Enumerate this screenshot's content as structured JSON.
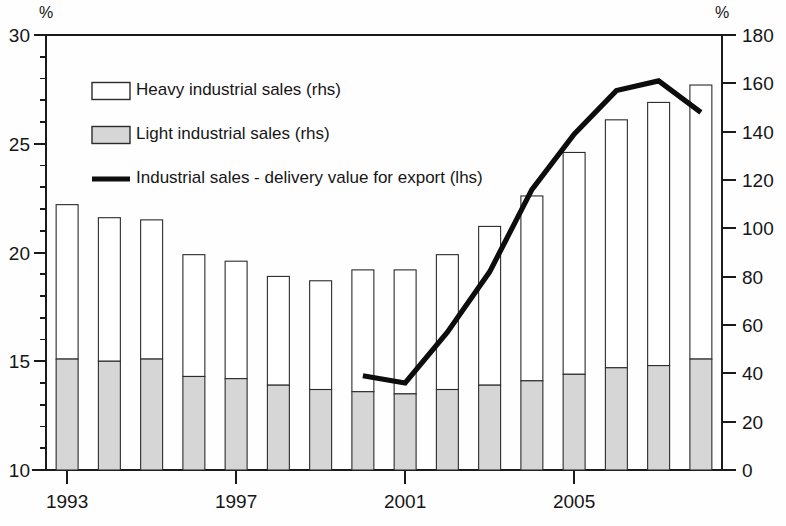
{
  "chart_data": {
    "type": "bar",
    "title": "",
    "subtitle": "",
    "xlabel": "",
    "ylabel": "%",
    "y2label": "%",
    "grid": false,
    "legend_position": "upper-left",
    "x": [
      1993,
      1994,
      1995,
      1996,
      1997,
      1998,
      1999,
      2000,
      2001,
      2002,
      2003,
      2004,
      2005,
      2006,
      2007,
      2008
    ],
    "categories": [
      "1993",
      "1994",
      "1995",
      "1996",
      "1997",
      "1998",
      "1999",
      "2000",
      "2001",
      "2002",
      "2003",
      "2004",
      "2005",
      "2006",
      "2007",
      "2008"
    ],
    "xtick_labels": [
      "1993",
      "1997",
      "2001",
      "2005"
    ],
    "xtick_values": [
      1993,
      1997,
      2001,
      2005
    ],
    "left_axis": {
      "label": "%",
      "min": 10,
      "max": 30,
      "ticks": [
        10,
        15,
        20,
        25,
        30
      ],
      "tick_labels": [
        "10",
        "15",
        "20",
        "25",
        "30"
      ]
    },
    "right_axis": {
      "label": "%",
      "min": 0,
      "max": 180,
      "ticks": [
        0,
        20,
        40,
        60,
        80,
        100,
        120,
        140,
        160,
        180
      ],
      "tick_labels": [
        "0",
        "20",
        "40",
        "60",
        "80",
        "100",
        "120",
        "140",
        "160",
        "180"
      ]
    },
    "series": [
      {
        "name": "Heavy industrial sales (rhs)",
        "type": "bar-stacked-top",
        "axis": "left",
        "values": [
          22.2,
          21.6,
          21.5,
          19.9,
          19.6,
          18.9,
          18.7,
          19.2,
          19.2,
          19.9,
          21.2,
          22.6,
          24.6,
          26.1,
          26.9,
          27.7
        ]
      },
      {
        "name": "Light industrial sales (rhs)",
        "type": "bar-stacked-bottom",
        "axis": "left",
        "values": [
          15.1,
          15.0,
          15.1,
          14.3,
          14.2,
          13.9,
          13.7,
          13.6,
          13.5,
          13.7,
          13.9,
          14.1,
          14.4,
          14.7,
          14.8,
          15.1
        ]
      },
      {
        "name": "Industrial sales - delivery value for export (lhs)",
        "type": "line",
        "axis": "right",
        "x": [
          2000,
          2001,
          2002,
          2003,
          2004,
          2005,
          2006,
          2007,
          2008
        ],
        "values": [
          39,
          36,
          57,
          82,
          116,
          139,
          157,
          161,
          148
        ]
      }
    ]
  },
  "legend": {
    "items": [
      {
        "label": "Heavy industrial sales (rhs)",
        "marker": "open-rect-swatch"
      },
      {
        "label": "Light industrial sales (rhs)",
        "marker": "gray-rect-swatch"
      },
      {
        "label": "Industrial sales - delivery value for export (lhs)",
        "marker": "thick-line-swatch"
      }
    ]
  },
  "colors": {
    "light_bar_fill": "#d6d6d6",
    "heavy_bar_fill": "#ffffff",
    "bar_stroke": "#2b2b2b",
    "line_color": "#0d0d0d",
    "axis_color": "#1a1a1a",
    "text_color": "#161616",
    "background": "#ffffff"
  }
}
